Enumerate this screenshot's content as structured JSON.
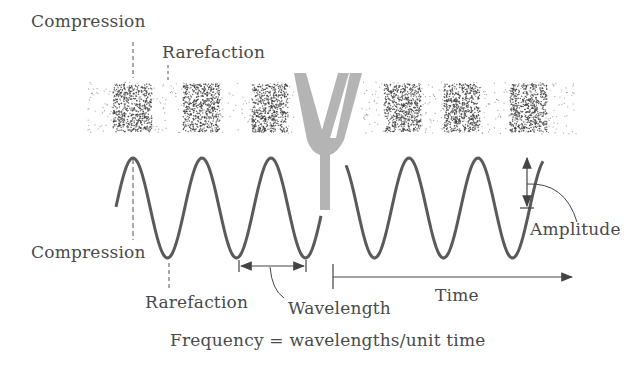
{
  "labels": {
    "compression_top": "Compression",
    "rarefaction_top": "Rarefaction",
    "compression_bottom": "Compression",
    "rarefaction_bottom": "Rarefaction",
    "amplitude": "Amplitude",
    "wavelength": "Wavelength",
    "time": "Time",
    "frequency_formula": "Frequency = wavelengths/unit time"
  },
  "colors": {
    "wave": "#5a5a5a",
    "tuning_fork": "#b4b4b4",
    "text": "#4a4a4a",
    "particles": "#333333"
  },
  "elements": {
    "tuning_fork": "tuning-fork-illustration",
    "air_particles": "air-molecule-density-band",
    "sine_wave": "pressure-wave"
  }
}
